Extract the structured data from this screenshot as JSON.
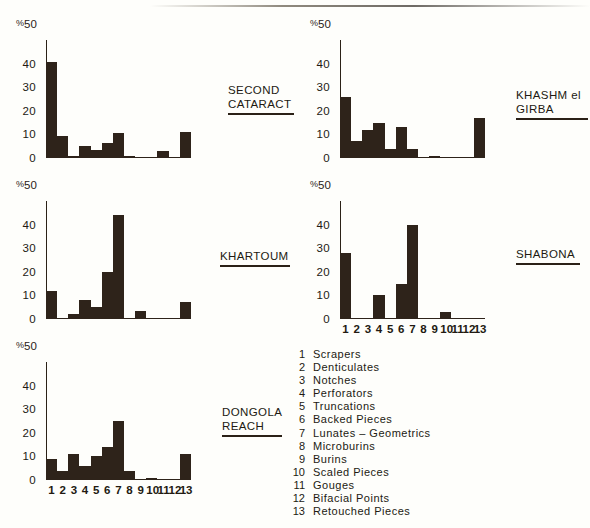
{
  "figure": {
    "background": "#fefefb",
    "ink": "#2e231a"
  },
  "axis": {
    "y_top_label": "%50",
    "y_percent_symbol": "%",
    "y_top_value": "50",
    "y_ticks": [
      "40",
      "30",
      "20",
      "10",
      "0"
    ],
    "y_max": 50,
    "x_labels": [
      "1",
      "2",
      "3",
      "4",
      "5",
      "6",
      "7",
      "8",
      "9",
      "10",
      "11",
      "12",
      "13"
    ]
  },
  "legend": {
    "items": [
      {
        "num": "1",
        "label": "Scrapers"
      },
      {
        "num": "2",
        "label": "Denticulates"
      },
      {
        "num": "3",
        "label": "Notches"
      },
      {
        "num": "4",
        "label": "Perforators"
      },
      {
        "num": "5",
        "label": "Truncations"
      },
      {
        "num": "6",
        "label": "Backed  Pieces"
      },
      {
        "num": "7",
        "label": "Lunates – Geometrics"
      },
      {
        "num": "8",
        "label": "Microburins"
      },
      {
        "num": "9",
        "label": "Burins"
      },
      {
        "num": "10",
        "label": "Scaled  Pieces"
      },
      {
        "num": "11",
        "label": "Gouges"
      },
      {
        "num": "12",
        "label": "Bifacial  Points"
      },
      {
        "num": "13",
        "label": "Retouched  Pieces"
      }
    ]
  },
  "chart_data": [
    {
      "type": "bar",
      "id": "second-cataract",
      "title": "SECOND CATARACT",
      "title_lines": [
        "SECOND",
        "CATARACT"
      ],
      "categories": [
        "1",
        "2",
        "3",
        "4",
        "5",
        "6",
        "7",
        "8",
        "9",
        "10",
        "11",
        "12",
        "13"
      ],
      "values": [
        40.5,
        9.5,
        1,
        5,
        3.5,
        6.5,
        10.5,
        1,
        0,
        0,
        3,
        0,
        11
      ],
      "xlabel": "",
      "ylabel": "%",
      "ylim": [
        0,
        50
      ],
      "yticks": [
        0,
        10,
        20,
        30,
        40,
        50
      ],
      "grid": false,
      "xticklabels_shown": false
    },
    {
      "type": "bar",
      "id": "khashm-el-girba",
      "title": "KHASHM el GIRBA",
      "title_lines": [
        "KHASHM el",
        "GIRBA"
      ],
      "categories": [
        "1",
        "2",
        "3",
        "4",
        "5",
        "6",
        "7",
        "8",
        "9",
        "10",
        "11",
        "12",
        "13"
      ],
      "values": [
        26,
        7,
        12,
        15,
        4,
        13,
        4,
        0,
        1,
        0,
        0,
        0,
        17
      ],
      "xlabel": "",
      "ylabel": "%",
      "ylim": [
        0,
        50
      ],
      "yticks": [
        0,
        10,
        20,
        30,
        40,
        50
      ],
      "grid": false,
      "xticklabels_shown": false
    },
    {
      "type": "bar",
      "id": "khartoum",
      "title": "KHARTOUM",
      "title_lines": [
        "KHARTOUM"
      ],
      "categories": [
        "1",
        "2",
        "3",
        "4",
        "5",
        "6",
        "7",
        "8",
        "9",
        "10",
        "11",
        "12",
        "13"
      ],
      "values": [
        12,
        0,
        2,
        8,
        5,
        20,
        44,
        0,
        3.5,
        0,
        0,
        0,
        7
      ],
      "xlabel": "",
      "ylabel": "%",
      "ylim": [
        0,
        50
      ],
      "yticks": [
        0,
        10,
        20,
        30,
        40,
        50
      ],
      "grid": false,
      "xticklabels_shown": false
    },
    {
      "type": "bar",
      "id": "shabona",
      "title": "SHABONA",
      "title_lines": [
        "SHABONA"
      ],
      "categories": [
        "1",
        "2",
        "3",
        "4",
        "5",
        "6",
        "7",
        "8",
        "9",
        "10",
        "11",
        "12",
        "13"
      ],
      "values": [
        28,
        0,
        0,
        10,
        0.5,
        15,
        40,
        0,
        0.5,
        3,
        0,
        0,
        0.5
      ],
      "xlabel": "",
      "ylabel": "%",
      "ylim": [
        0,
        50
      ],
      "yticks": [
        0,
        10,
        20,
        30,
        40,
        50
      ],
      "grid": false,
      "xticklabels_shown": true
    },
    {
      "type": "bar",
      "id": "dongola-reach",
      "title": "DONGOLA REACH",
      "title_lines": [
        "DONGOLA",
        "REACH"
      ],
      "categories": [
        "1",
        "2",
        "3",
        "4",
        "5",
        "6",
        "7",
        "8",
        "9",
        "10",
        "11",
        "12",
        "13"
      ],
      "values": [
        9,
        4,
        11,
        6,
        10,
        14,
        25,
        4,
        0,
        1,
        0,
        0,
        11
      ],
      "xlabel": "",
      "ylabel": "%",
      "ylim": [
        0,
        50
      ],
      "yticks": [
        0,
        10,
        20,
        30,
        40,
        50
      ],
      "grid": false,
      "xticklabels_shown": true
    }
  ]
}
